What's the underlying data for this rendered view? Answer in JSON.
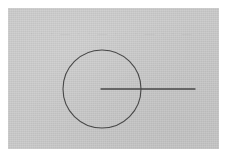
{
  "canvas": {
    "width": 229,
    "height": 159,
    "margin_color": "#ffffff",
    "paper_color": "#c9c9c9",
    "ink_color": "#474747",
    "paper_left": 8,
    "paper_top": 8,
    "paper_width": 211,
    "paper_height": 141
  },
  "watermark": {
    "text": "· · · — · · — · · · — · · — · · ·",
    "visible": true
  },
  "figure": {
    "shapes": [
      {
        "name": "circle",
        "type": "circle",
        "center_x": 94,
        "center_y": 81,
        "radius": 39,
        "stroke_width": 1.1,
        "stroke": "#474747",
        "fill": "none"
      },
      {
        "name": "radius-line",
        "type": "line",
        "x1": 93,
        "y1": 81,
        "x2": 187,
        "y2": 81,
        "stroke_width": 1.3,
        "stroke": "#474747",
        "label": "radius extended beyond circumference"
      }
    ],
    "center_point": {
      "name": "circle-center",
      "x": 94,
      "y": 81
    }
  }
}
